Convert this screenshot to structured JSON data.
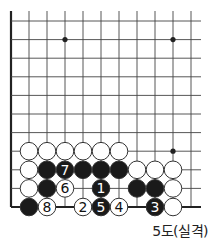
{
  "diagram": {
    "caption": "5도(실격)",
    "grid": {
      "origin_x": 11,
      "origin_y": 21,
      "col_spacing": 18,
      "row_spacing": 18.6,
      "cols": 11,
      "rows": 11,
      "right_extent": 201,
      "top_extent": 11,
      "left_edge": true,
      "bottom_edge": true
    },
    "star_points": [
      {
        "col": 3,
        "row": 1
      },
      {
        "col": 9,
        "row": 1
      },
      {
        "col": 9,
        "row": 7
      }
    ],
    "stones": [
      {
        "col": 1,
        "row": 7,
        "color": "white",
        "label": ""
      },
      {
        "col": 2,
        "row": 7,
        "color": "white",
        "label": ""
      },
      {
        "col": 3,
        "row": 7,
        "color": "white",
        "label": ""
      },
      {
        "col": 4,
        "row": 7,
        "color": "white",
        "label": ""
      },
      {
        "col": 5,
        "row": 7,
        "color": "white",
        "label": ""
      },
      {
        "col": 6,
        "row": 7,
        "color": "white",
        "label": ""
      },
      {
        "col": 1,
        "row": 8,
        "color": "white",
        "label": ""
      },
      {
        "col": 2,
        "row": 8,
        "color": "black",
        "label": ""
      },
      {
        "col": 3,
        "row": 8,
        "color": "black",
        "label": "7"
      },
      {
        "col": 4,
        "row": 8,
        "color": "black",
        "label": ""
      },
      {
        "col": 5,
        "row": 8,
        "color": "black",
        "label": ""
      },
      {
        "col": 6,
        "row": 8,
        "color": "black",
        "label": ""
      },
      {
        "col": 7,
        "row": 8,
        "color": "white",
        "label": ""
      },
      {
        "col": 8,
        "row": 8,
        "color": "white",
        "label": ""
      },
      {
        "col": 9,
        "row": 8,
        "color": "white",
        "label": ""
      },
      {
        "col": 1,
        "row": 9,
        "color": "white",
        "label": ""
      },
      {
        "col": 2,
        "row": 9,
        "color": "black",
        "label": ""
      },
      {
        "col": 3,
        "row": 9,
        "color": "white",
        "label": "6"
      },
      {
        "col": 5,
        "row": 9,
        "color": "black",
        "label": "1"
      },
      {
        "col": 7,
        "row": 9,
        "color": "black",
        "label": ""
      },
      {
        "col": 8,
        "row": 9,
        "color": "black",
        "label": ""
      },
      {
        "col": 9,
        "row": 9,
        "color": "white",
        "label": ""
      },
      {
        "col": 1,
        "row": 10,
        "color": "black",
        "label": ""
      },
      {
        "col": 2,
        "row": 10,
        "color": "white",
        "label": "8"
      },
      {
        "col": 4,
        "row": 10,
        "color": "white",
        "label": "2"
      },
      {
        "col": 5,
        "row": 10,
        "color": "black",
        "label": "5"
      },
      {
        "col": 6,
        "row": 10,
        "color": "white",
        "label": "4"
      },
      {
        "col": 8,
        "row": 10,
        "color": "black",
        "label": "3"
      },
      {
        "col": 9,
        "row": 10,
        "color": "white",
        "label": ""
      }
    ],
    "colors": {
      "line": "#444444",
      "edge": "#222222",
      "black_stone": "#1a1a1a",
      "white_stone": "#ffffff",
      "stone_outline": "#333333"
    }
  }
}
